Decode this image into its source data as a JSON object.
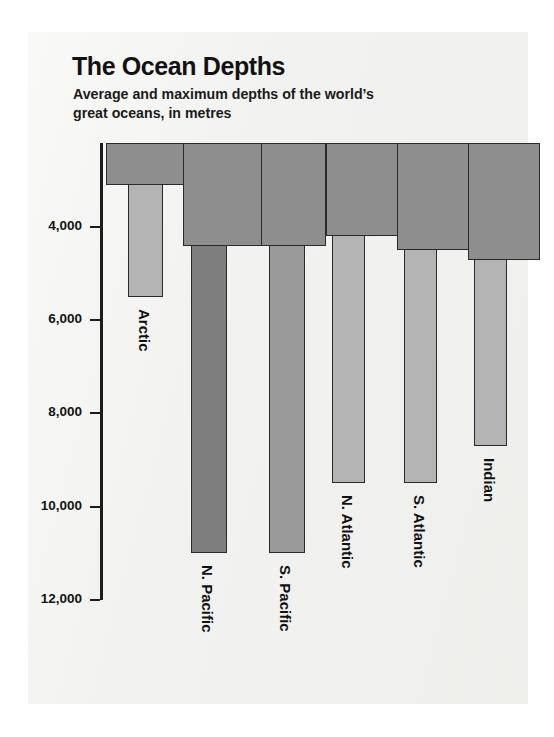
{
  "title": "The Ocean Depths",
  "subtitle": "Average and maximum depths of the world’s great oceans, in metres",
  "axis": {
    "tick_labels": [
      "4,000",
      "6,000",
      "8,000",
      "10,000",
      "12,000"
    ],
    "tick_values": [
      4000,
      6000,
      8000,
      10000,
      12000
    ]
  },
  "oceans": [
    {
      "name": "Arctic",
      "average": 1200,
      "maximum": 5500
    },
    {
      "name": "N. Pacific",
      "average": 4400,
      "maximum": 11000
    },
    {
      "name": "S. Pacific",
      "average": 4400,
      "maximum": 11000
    },
    {
      "name": "N. Atlantic",
      "average": 4200,
      "maximum": 9500
    },
    {
      "name": "S. Atlantic",
      "average": 4500,
      "maximum": 9500
    },
    {
      "name": "Indian",
      "average": 4700,
      "maximum": 8700
    }
  ],
  "colors": {
    "panel": "#f2f2f0",
    "average_bar": "#8e8e8e",
    "maximum_bar": "#9a9a9a",
    "outline": "#2a2a2a",
    "text": "#121212"
  },
  "chart_data": {
    "type": "bar",
    "title": "The Ocean Depths",
    "subtitle": "Average and maximum depths of the world’s great oceans, in metres",
    "xlabel": "",
    "ylabel": "Depth (metres)",
    "categories": [
      "Arctic",
      "N. Pacific",
      "S. Pacific",
      "N. Atlantic",
      "S. Atlantic",
      "Indian"
    ],
    "series": [
      {
        "name": "Average depth",
        "values": [
          1200,
          4400,
          4400,
          4200,
          4500,
          4700
        ]
      },
      {
        "name": "Maximum depth",
        "values": [
          5500,
          11000,
          11000,
          9500,
          9500,
          8700
        ]
      }
    ],
    "ylim": [
      2200,
      12000
    ],
    "y_inverted": true,
    "yticks": [
      4000,
      6000,
      8000,
      10000,
      12000
    ],
    "ytick_labels": [
      "4,000",
      "6,000",
      "8,000",
      "10,000",
      "12,000"
    ],
    "grid": false,
    "legend": "none",
    "orientation": "vertical-downward"
  }
}
